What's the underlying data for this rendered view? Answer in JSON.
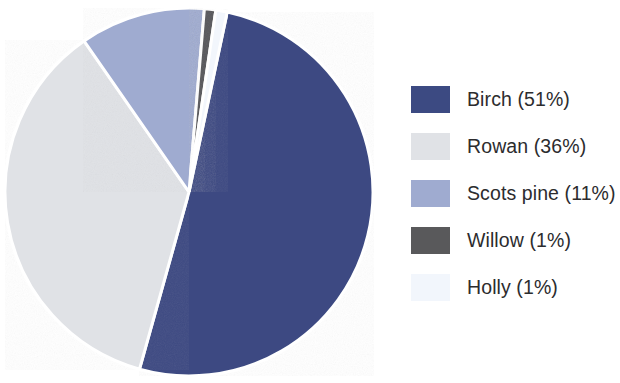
{
  "chart_data": {
    "type": "pie",
    "title": "",
    "subtitle": "",
    "xlabel": "",
    "ylabel": "",
    "legend_position": "right",
    "grid": false,
    "units": "percent",
    "start_angle_deg": 12,
    "direction": "clockwise",
    "categories": [
      "Birch",
      "Rowan",
      "Scots pine",
      "Willow",
      "Holly"
    ],
    "values": [
      51,
      36,
      11,
      1,
      1
    ],
    "slices": [
      {
        "name": "Birch",
        "value": 51,
        "label": "Birch (51%)",
        "percent_text": "51%",
        "color": "#3c4a82",
        "start_deg": 12.0,
        "end_deg": 195.6
      },
      {
        "name": "Rowan",
        "value": 36,
        "label": "Rowan (36%)",
        "percent_text": "36%",
        "color": "#e0e2e6",
        "start_deg": 195.6,
        "end_deg": 325.2
      },
      {
        "name": "Scots pine",
        "value": 11,
        "label": "Scots pine (11%)",
        "percent_text": "11%",
        "color": "#9fabd0",
        "start_deg": 325.2,
        "end_deg": 364.8
      },
      {
        "name": "Willow",
        "value": 1,
        "label": "Willow (1%)",
        "percent_text": "1%",
        "color": "#59595b",
        "start_deg": 364.8,
        "end_deg": 368.4
      },
      {
        "name": "Holly",
        "value": 1,
        "label": "Holly (1%)",
        "percent_text": "1%",
        "color": "#f2f6fc",
        "start_deg": 368.4,
        "end_deg": 372.0
      }
    ]
  },
  "pie": {
    "center_x": 189,
    "center_y": 192,
    "radius": 184,
    "separator_color": "#ffffff",
    "separator_width": 3
  },
  "legend": {
    "items": [
      {
        "label": "Birch (51%)",
        "color": "#3c4a82",
        "swatch_name": "legend-swatch-birch"
      },
      {
        "label": "Rowan (36%)",
        "color": "#e0e2e6",
        "swatch_name": "legend-swatch-rowan"
      },
      {
        "label": "Scots pine (11%)",
        "color": "#9fabd0",
        "swatch_name": "legend-swatch-scots-pine"
      },
      {
        "label": "Willow (1%)",
        "color": "#59595b",
        "swatch_name": "legend-swatch-willow"
      },
      {
        "label": "Holly (1%)",
        "color": "#f2f6fc",
        "swatch_name": "legend-swatch-holly"
      }
    ]
  },
  "colors": {
    "background": "#ffffff",
    "text": "#2c2c2e",
    "birch": "#3c4a82",
    "rowan": "#e0e2e6",
    "scots_pine": "#9fabd0",
    "willow": "#59595b",
    "holly": "#f2f6fc"
  }
}
